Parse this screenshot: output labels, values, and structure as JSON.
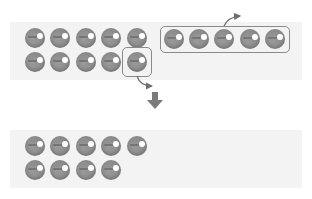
{
  "diagram": {
    "top_panel": {
      "grid_rows": [
        5,
        5
      ],
      "grouped_row_count": 5,
      "highlighted_single_count": 1,
      "total": 15
    },
    "bottom_panel": {
      "grid_rows": [
        5,
        4
      ],
      "total": 9
    },
    "colors": {
      "ball": "#8c8c8c",
      "ball_highlight": "#ffffff",
      "panel_bg": "#f3f3f3",
      "outline": "#8a8a8a",
      "arrow": "#7a7a7a"
    }
  }
}
